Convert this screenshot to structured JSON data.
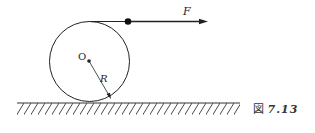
{
  "diagram": {
    "force_label": "F",
    "center_label": "O",
    "radius_label": "R",
    "caption_prefix": "図",
    "caption_number": "7.13",
    "colors": {
      "stroke": "#222222",
      "background": "#ffffff"
    }
  }
}
